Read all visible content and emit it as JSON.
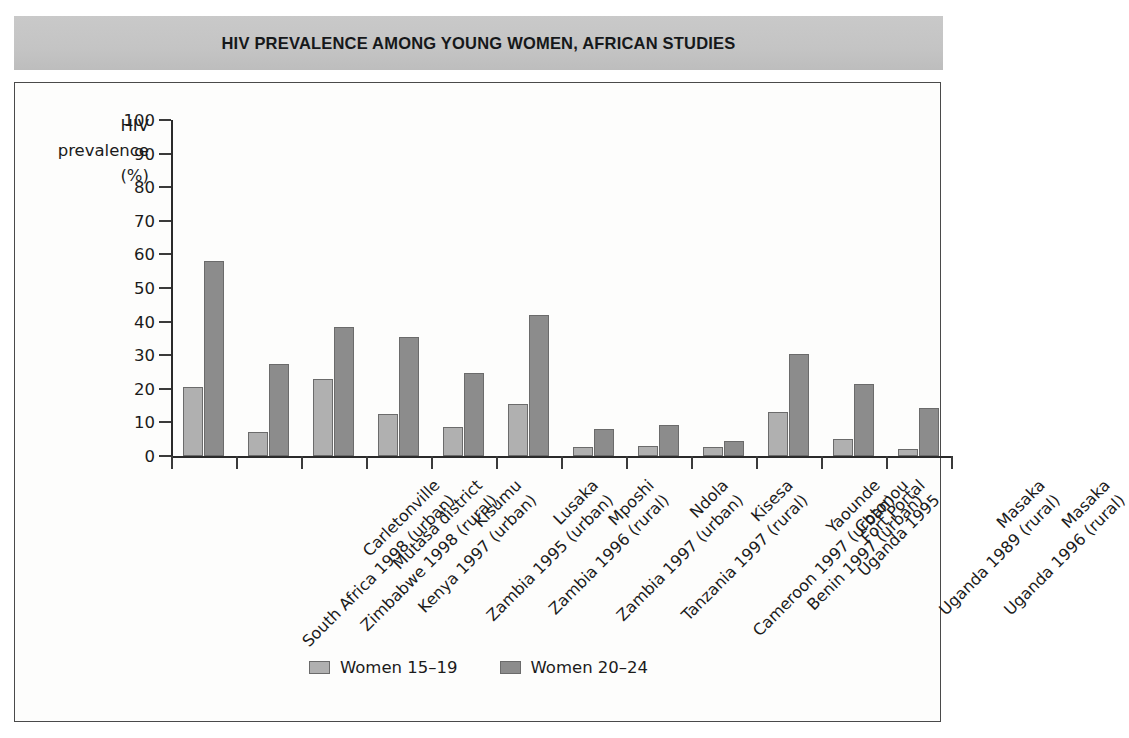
{
  "header": {
    "title": "HIV PREVALENCE AMONG YOUNG WOMEN, AFRICAN STUDIES"
  },
  "axis_title": {
    "line1": "HIV",
    "line2": "prevalence",
    "line3": "(%)"
  },
  "legend": {
    "items": [
      {
        "label": "Women 15–19",
        "color": "#b0b0b0",
        "key": "young"
      },
      {
        "label": "Women 20–24",
        "color": "#8c8c8c",
        "key": "older"
      }
    ]
  },
  "chart_data": {
    "type": "bar",
    "title": "HIV PREVALENCE AMONG YOUNG WOMEN, AFRICAN STUDIES",
    "xlabel": "",
    "ylabel": "HIV prevalence (%)",
    "ylim": [
      0,
      100
    ],
    "yticks": [
      0,
      10,
      20,
      30,
      40,
      50,
      60,
      70,
      80,
      90,
      100
    ],
    "grid": false,
    "legend_position": "bottom",
    "categories": [
      "Carletonville South Africa 1998 (urban)",
      "Mutasa district Zimbabwe 1998 (rural)",
      "Kisumu Kenya 1997 (urban)",
      "Lusaka Zambia 1995 (urban)",
      "Mposhi Zambia 1996 (rural)",
      "Ndola Zambia 1997 (urban)",
      "Kisesa Tanzania 1997 (rural)",
      "Yaounde Cameroon 1997 (urban)",
      "Cotonou Benin 1997 (urban)",
      "Fort Portal Uganda 1995",
      "Masaka Uganda 1989 (rural)",
      "Masaka Uganda 1996 (rural)"
    ],
    "category_labels": [
      {
        "line1": "Carletonville",
        "line2": "South Africa 1998 (urban)"
      },
      {
        "line1": "Mutasa district",
        "line2": "Zimbabwe 1998 (rural)"
      },
      {
        "line1": "Kisumu",
        "line2": "Kenya 1997 (urban)"
      },
      {
        "line1": "Lusaka",
        "line2": "Zambia 1995 (urban)"
      },
      {
        "line1": "Mposhi",
        "line2": "Zambia 1996 (rural)"
      },
      {
        "line1": "Ndola",
        "line2": "Zambia 1997 (urban)"
      },
      {
        "line1": "Kisesa",
        "line2": "Tanzania 1997 (rural)"
      },
      {
        "line1": "Yaounde",
        "line2": "Cameroon 1997 (urban)"
      },
      {
        "line1": "Cotonou",
        "line2": "Benin 1997 (urban)"
      },
      {
        "line1": "Fort Portal",
        "line2": "Uganda 1995"
      },
      {
        "line1": "Masaka",
        "line2": "Uganda 1989 (rural)"
      },
      {
        "line1": "Masaka",
        "line2": "Uganda 1996 (rural)"
      }
    ],
    "series": [
      {
        "name": "Women 15–19",
        "color": "#b0b0b0",
        "values": [
          20.5,
          7.0,
          23.0,
          12.5,
          8.5,
          15.5,
          2.7,
          3.0,
          2.8,
          13.0,
          5.0,
          2.0
        ]
      },
      {
        "name": "Women 20–24",
        "color": "#8c8c8c",
        "values": [
          58.0,
          27.5,
          38.5,
          35.5,
          24.8,
          42.0,
          8.0,
          9.3,
          4.5,
          30.5,
          21.5,
          14.3
        ]
      }
    ]
  }
}
